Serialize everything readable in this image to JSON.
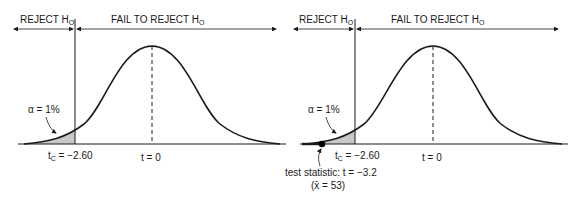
{
  "left_panel": {
    "reject_label": "REJECT H",
    "reject_sub": "O",
    "fail_label": "FAIL TO REJECT H",
    "fail_sub": "O",
    "alpha_label": "α = 1%",
    "critical_label_main": "t",
    "critical_label_sub": "C",
    "critical_label_value": " = −2.60",
    "center_label": "t = 0"
  },
  "right_panel": {
    "reject_label": "REJECT H",
    "reject_sub": "O",
    "fail_label": "FAIL TO REJECT H",
    "fail_sub": "O",
    "alpha_label": "α = 1%",
    "critical_label_main": "t",
    "critical_label_sub": "C",
    "critical_label_value": " = −2.60",
    "center_label": "t = 0",
    "test_statistic_label": "test statistic: t = −3.2",
    "sample_mean_label": "(x̄ = 53)"
  },
  "colors": {
    "curve": "#1a1a1a",
    "shade": "#c8c8c8",
    "dot": "#000000"
  }
}
